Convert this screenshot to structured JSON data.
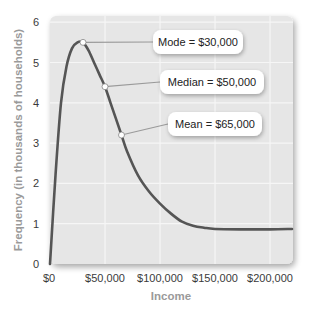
{
  "chart_data": {
    "type": "line",
    "title": "",
    "xlabel": "Income",
    "ylabel": "Frequency (in thousands of households)",
    "xlim": [
      0,
      220000
    ],
    "ylim": [
      0,
      6
    ],
    "grid": true,
    "x_ticks": [
      "$0",
      "$50,000",
      "$100,000",
      "$150,000",
      "$200,000"
    ],
    "x_tick_values": [
      0,
      50000,
      100000,
      150000,
      200000
    ],
    "y_ticks": [
      "0",
      "1",
      "2",
      "3",
      "4",
      "5",
      "6"
    ],
    "series": [
      {
        "name": "Income distribution",
        "x": [
          0,
          5000,
          10000,
          15000,
          20000,
          25000,
          30000,
          35000,
          40000,
          45000,
          50000,
          55000,
          60000,
          65000,
          70000,
          80000,
          90000,
          100000,
          110000,
          120000,
          130000,
          140000,
          150000,
          175000,
          200000,
          220000
        ],
        "values": [
          0,
          2.2,
          4.0,
          4.9,
          5.35,
          5.5,
          5.5,
          5.3,
          5.0,
          4.7,
          4.4,
          4.0,
          3.6,
          3.2,
          2.8,
          2.2,
          1.8,
          1.5,
          1.25,
          1.05,
          0.95,
          0.9,
          0.87,
          0.86,
          0.86,
          0.87
        ]
      }
    ],
    "annotations": [
      {
        "label": "Mode = $30,000",
        "x": 30000,
        "y": 5.5
      },
      {
        "label": "Median = $50,000",
        "x": 50000,
        "y": 4.4
      },
      {
        "label": "Mean = $65,000",
        "x": 65000,
        "y": 3.2
      }
    ]
  },
  "labels": {
    "xlabel": "Income",
    "ylabel": "Frequency (in thousands of households)",
    "mode": "Mode = $30,000",
    "median": "Median = $50,000",
    "mean": "Mean = $65,000"
  }
}
